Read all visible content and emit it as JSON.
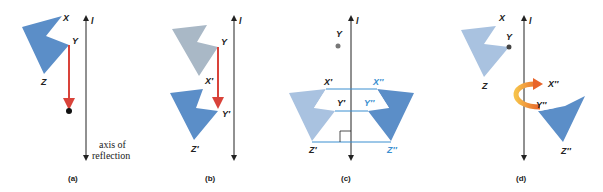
{
  "figure": {
    "panels": [
      {
        "id": "a",
        "caption": "(a)",
        "labels": {
          "x": "X",
          "y": "Y",
          "z": "Z",
          "axis": "l"
        },
        "axis_note_line1": "axis of",
        "axis_note_line2": "reflection"
      },
      {
        "id": "b",
        "caption": "(b)",
        "labels": {
          "y": "Y",
          "x_prime": "X′",
          "y_prime": "Y′",
          "z_prime": "Z′",
          "axis": "l"
        }
      },
      {
        "id": "c",
        "caption": "(c)",
        "labels": {
          "y": "Y",
          "x_prime": "X′",
          "y_prime": "Y′",
          "z_prime": "Z′",
          "x_dprime": "X′′",
          "y_dprime": "Y′′",
          "z_dprime": "Z′′",
          "axis": "l"
        }
      },
      {
        "id": "d",
        "caption": "(d)",
        "labels": {
          "x": "X",
          "y": "Y",
          "z": "Z",
          "x_dprime": "X′′",
          "y_dprime": "Y′′",
          "z_dprime": "Z′′",
          "axis": "l"
        }
      }
    ],
    "colors": {
      "shape_dark": "#5b8ec8",
      "shape_light": "#a9c2e0",
      "shape_gray": "#a9b8c6",
      "arrow_red": "#d9433a",
      "rotate_orange": "#f08a2a",
      "line_blue": "#3a8fd0",
      "axis": "#222222"
    }
  }
}
